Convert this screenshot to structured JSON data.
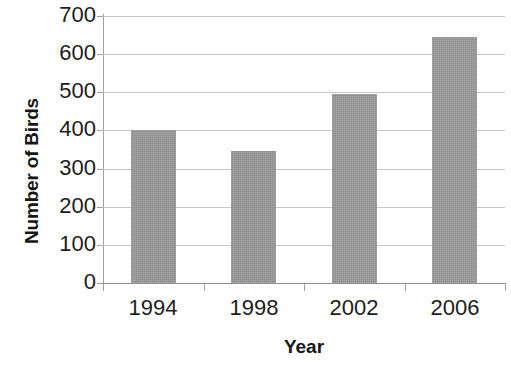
{
  "chart_data": {
    "type": "bar",
    "title": "",
    "categories": [
      "1994",
      "1998",
      "2002",
      "2006"
    ],
    "values": [
      400,
      345,
      495,
      645
    ],
    "xlabel": "Year",
    "ylabel": "Number of Birds",
    "ylim": [
      0,
      700
    ],
    "yticks": [
      0,
      100,
      200,
      300,
      400,
      500,
      600,
      700
    ],
    "ytick_labels": [
      "0",
      "100",
      "200",
      "300",
      "400",
      "500",
      "600",
      "700"
    ],
    "grid": true,
    "legend": "none",
    "series": [
      {
        "name": "Number of Birds",
        "color": "#9a9a9a",
        "values": [
          400,
          345,
          495,
          645
        ]
      }
    ],
    "bar_color": "#9a9a9a",
    "gridline_color": "#c8c8c8",
    "axis_color": "#9f9f9f",
    "background": "#ffffff"
  }
}
